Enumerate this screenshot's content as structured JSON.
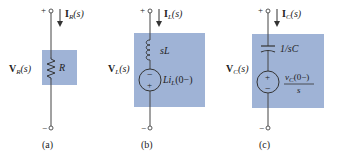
{
  "colors": {
    "box_fill": "#9fb3d6",
    "wire": "#444444"
  },
  "circuits": [
    {
      "id": "a",
      "caption": "(a)",
      "current": {
        "symbol": "I",
        "sub": "R",
        "arg": "(s)"
      },
      "voltage": {
        "symbol": "V",
        "sub": "R",
        "arg": "(s)"
      },
      "element_label": "R",
      "terminal_plus": "+",
      "terminal_minus": "−"
    },
    {
      "id": "b",
      "caption": "(b)",
      "current": {
        "symbol": "I",
        "sub": "L",
        "arg": "(s)"
      },
      "voltage": {
        "symbol": "V",
        "sub": "L",
        "arg": "(s)"
      },
      "element_label": "sL",
      "source_label": {
        "pre": "Li",
        "sub": "L",
        "post": "(0−)"
      },
      "source_top_sign": "−",
      "source_bottom_sign": "+",
      "terminal_plus": "+",
      "terminal_minus": "−"
    },
    {
      "id": "c",
      "caption": "(c)",
      "current": {
        "symbol": "I",
        "sub": "C",
        "arg": "(s)"
      },
      "voltage": {
        "symbol": "V",
        "sub": "C",
        "arg": "(s)"
      },
      "element_label": "1/sC",
      "source_label": {
        "num_pre": "v",
        "num_sub": "C",
        "num_post": "(0−)",
        "den": "s"
      },
      "source_top_sign": "+",
      "source_bottom_sign": "−",
      "terminal_plus": "+",
      "terminal_minus": "−"
    }
  ]
}
